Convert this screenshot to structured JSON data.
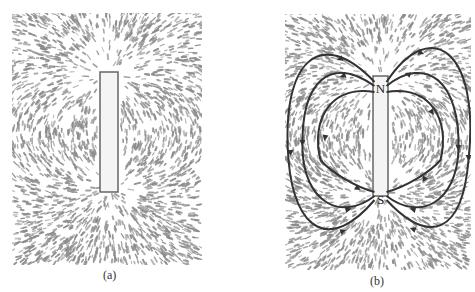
{
  "figure": {
    "panels": [
      {
        "id": "a",
        "caption": "(a)",
        "description": "iron filings around bar magnet"
      },
      {
        "id": "b",
        "caption": "(b)",
        "description": "iron filings with field lines drawn",
        "pole_top": "N",
        "pole_bottom": "S"
      }
    ]
  },
  "colors": {
    "filings": "#8a8a8a",
    "lines": "#333333",
    "magnet_fill": "#f4f4f4",
    "magnet_edge": "#666666"
  }
}
